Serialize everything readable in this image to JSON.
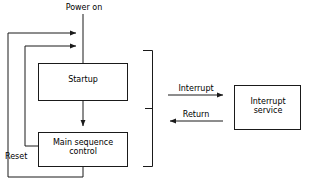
{
  "diagram": {
    "type": "flowchart",
    "background_color": "#ffffff",
    "line_color": "#1a1a1a",
    "text_color": "#000000",
    "nodes": [
      {
        "id": "startup",
        "label": "Startup",
        "shape": "rectangle"
      },
      {
        "id": "main_sequence",
        "label": "Main sequence\ncontrol",
        "line1": "Main sequence",
        "line2": "control",
        "shape": "rectangle"
      },
      {
        "id": "interrupt_service",
        "label": "Interrupt\nservice",
        "line1": "Interrupt",
        "line2": "service",
        "shape": "rectangle"
      }
    ],
    "edge_labels": [
      {
        "id": "power_on",
        "label": "Power on",
        "direction": "down"
      },
      {
        "id": "interrupt",
        "label": "Interrupt",
        "direction": "right"
      },
      {
        "id": "return",
        "label": "Return",
        "direction": "left"
      },
      {
        "id": "reset",
        "label": "Reset",
        "direction": "left"
      }
    ]
  }
}
